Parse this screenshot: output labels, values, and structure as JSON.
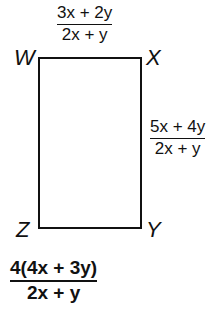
{
  "figure": {
    "shape": "rectangle",
    "vertices": {
      "top_left": "W",
      "top_right": "X",
      "bottom_right": "Y",
      "bottom_left": "Z"
    },
    "side_labels": {
      "top": {
        "numerator": "3x + 2y",
        "denominator": "2x + y"
      },
      "right": {
        "numerator": "5x + 4y",
        "denominator": "2x + y"
      }
    },
    "answer": {
      "numerator": "4(4x + 3y)",
      "denominator": "2x + y"
    }
  }
}
